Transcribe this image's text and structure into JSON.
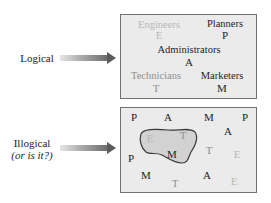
{
  "labels": {
    "logical": "Logical",
    "illogical_line1": "Illogical",
    "illogical_line2": "(or is it?)"
  },
  "logical_box": {
    "groups": [
      {
        "name": "Engineers",
        "letter": "E",
        "shade": "light"
      },
      {
        "name": "Planners",
        "letter": "P",
        "shade": "dark"
      },
      {
        "name": "Administrators",
        "letter": "A",
        "shade": "dark"
      },
      {
        "name": "Technicians",
        "letter": "T",
        "shade": "mid"
      },
      {
        "name": "Marketers",
        "letter": "M",
        "shade": "dark"
      }
    ]
  },
  "illogical_box": {
    "letters": [
      {
        "letter": "P",
        "shade": "dark"
      },
      {
        "letter": "A",
        "shade": "dark"
      },
      {
        "letter": "M",
        "shade": "dark"
      },
      {
        "letter": "P",
        "shade": "dark"
      },
      {
        "letter": "A",
        "shade": "dark"
      },
      {
        "letter": "E",
        "shade": "light"
      },
      {
        "letter": "T",
        "shade": "mid"
      },
      {
        "letter": "M",
        "shade": "dark"
      },
      {
        "letter": "T",
        "shade": "mid"
      },
      {
        "letter": "E",
        "shade": "light"
      },
      {
        "letter": "P",
        "shade": "dark"
      },
      {
        "letter": "M",
        "shade": "dark"
      },
      {
        "letter": "A",
        "shade": "dark"
      },
      {
        "letter": "T",
        "shade": "mid"
      },
      {
        "letter": "E",
        "shade": "light"
      }
    ],
    "blob_note": "cluster enclosing E, T, M"
  },
  "colors": {
    "box_background": "#ebebeb",
    "box_border": "#707070",
    "dark_text": "#1e1e1e",
    "mid_text": "#8e8e8e",
    "light_text": "#b8b8b8",
    "blob_fill": "#d2d2d2",
    "blob_stroke": "#3a3a3a"
  }
}
